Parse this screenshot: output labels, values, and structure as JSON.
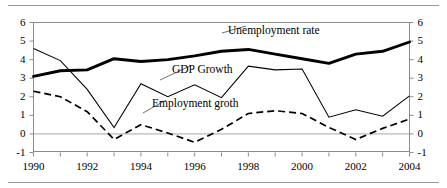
{
  "chart_data": {
    "type": "line",
    "title": "",
    "xlabel": "",
    "ylabel": "",
    "xlim": [
      1990,
      2004
    ],
    "ylim": [
      -1,
      6
    ],
    "grid": false,
    "zero_line": true,
    "dual_axis": true,
    "legend": "inline-annotations",
    "x": [
      1990,
      1991,
      1992,
      1993,
      1994,
      1995,
      1996,
      1997,
      1998,
      1999,
      2000,
      2001,
      2002,
      2003,
      2004
    ],
    "y_ticks_left": [
      "6",
      "5",
      "4",
      "3",
      "2",
      "1",
      "0",
      "-1"
    ],
    "y_ticks_right": [
      "6",
      "5",
      "4",
      "3",
      "2",
      "1",
      "0",
      "-1"
    ],
    "x_ticks": [
      "1990",
      "1992",
      "1994",
      "1996",
      "1998",
      "2000",
      "2002",
      "2004"
    ],
    "series": [
      {
        "name": "Unemployment rate",
        "style": "thick-solid",
        "color": "#000000",
        "values": [
          3.1,
          3.4,
          3.45,
          4.05,
          3.9,
          4.0,
          4.2,
          4.45,
          4.55,
          4.3,
          4.05,
          3.8,
          4.3,
          4.45,
          4.95
        ]
      },
      {
        "name": "GDP Growth",
        "style": "thin-solid",
        "color": "#000000",
        "values": [
          4.6,
          3.95,
          2.4,
          0.35,
          2.7,
          2.0,
          2.65,
          1.95,
          3.65,
          3.45,
          3.5,
          0.9,
          1.3,
          0.95,
          2.05
        ]
      },
      {
        "name": "Employment groth",
        "style": "dashed",
        "color": "#000000",
        "values": [
          2.3,
          2.0,
          1.2,
          -0.3,
          0.5,
          0.05,
          -0.45,
          0.25,
          1.1,
          1.25,
          1.1,
          0.35,
          -0.3,
          0.3,
          0.8
        ]
      }
    ],
    "annotations": [
      {
        "text": "Unemployment rate",
        "anchor_year": 1997.4,
        "anchor_value": 4.45
      },
      {
        "text": "GDP Growth",
        "anchor_year": 1994.8,
        "anchor_value": 2.1
      },
      {
        "text": "Employment groth",
        "anchor_year": 1993.8,
        "anchor_value": 0.5
      }
    ]
  }
}
